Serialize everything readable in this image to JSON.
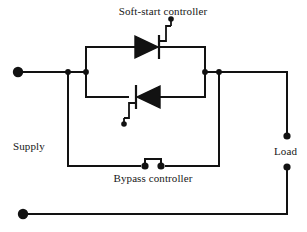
{
  "diagram": {
    "type": "schematic",
    "background_color": "#ffffff",
    "line_color": "#121212",
    "labels": {
      "soft_start": "Soft-start controller",
      "bypass": "Bypass controller",
      "supply": "Supply",
      "load": "Load"
    },
    "components": [
      {
        "name": "thyristor-upper",
        "kind": "scr",
        "orientation": "anode-left-cathode-right",
        "gate_side": "top"
      },
      {
        "name": "thyristor-lower",
        "kind": "scr",
        "orientation": "anode-right-cathode-left",
        "gate_side": "bottom"
      },
      {
        "name": "bypass-contactor",
        "kind": "closed-contact",
        "state": "closed"
      }
    ],
    "terminals": [
      {
        "name": "supply-top-terminal",
        "position": "left-upper"
      },
      {
        "name": "supply-bottom-terminal",
        "position": "left-lower"
      },
      {
        "name": "load-top-terminal",
        "position": "right-upper"
      },
      {
        "name": "load-bottom-terminal",
        "position": "right-lower"
      },
      {
        "name": "gate-terminal-upper",
        "position": "top-center"
      },
      {
        "name": "gate-terminal-lower",
        "position": "center-lower"
      }
    ]
  }
}
